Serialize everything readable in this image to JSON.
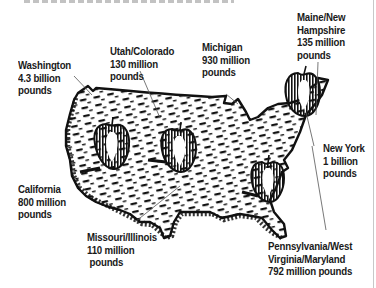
{
  "figure": {
    "title_partial": "",
    "regions": [
      {
        "id": "washington",
        "lines": [
          "Washington",
          "4.3 billion",
          "pounds"
        ],
        "name": "Washington",
        "amount": "4.3 billion pounds"
      },
      {
        "id": "utah-colorado",
        "lines": [
          "Utah/Colorado",
          "130 million",
          "pounds"
        ],
        "name": "Utah/Colorado",
        "amount": "130 million pounds"
      },
      {
        "id": "michigan",
        "lines": [
          "Michigan",
          "930 million",
          "pounds"
        ],
        "name": "Michigan",
        "amount": "930 million pounds"
      },
      {
        "id": "maine-nh",
        "lines": [
          "Maine/New",
          "Hampshire",
          "135 million",
          "pounds"
        ],
        "name": "Maine/New Hampshire",
        "amount": "135 million pounds"
      },
      {
        "id": "new-york",
        "lines": [
          "New York",
          "1 billion",
          "pounds"
        ],
        "name": "New York",
        "amount": "1 billion pounds"
      },
      {
        "id": "california",
        "lines": [
          "California",
          "800 million",
          "pounds"
        ],
        "name": "California",
        "amount": "800 million pounds"
      },
      {
        "id": "missouri-illinois",
        "lines": [
          "Missouri/Illinois",
          "110 million",
          " pounds"
        ],
        "name": "Missouri/Illinois",
        "amount": "110 million pounds"
      },
      {
        "id": "pa-wv-md",
        "lines": [
          "Pennsylvania/West",
          "Virginia/Maryland",
          "792 million pounds"
        ],
        "name": "Pennsylvania/West Virginia/Maryland",
        "amount": "792 million pounds"
      }
    ],
    "colors": {
      "ink": "#111111",
      "text": "#1a1a1a",
      "leader": "#555555",
      "background": "#ffffff"
    }
  }
}
